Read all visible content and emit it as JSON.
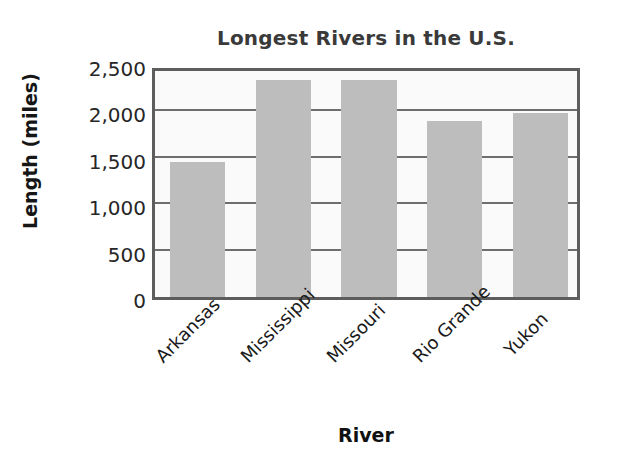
{
  "chart_data": {
    "type": "bar",
    "title": "Longest Rivers in the U.S.",
    "xlabel": "River",
    "ylabel": "Length (miles)",
    "categories": [
      "Arkansas",
      "Mississippi",
      "Missouri",
      "Rio Grande",
      "Yukon"
    ],
    "values": [
      1460,
      2340,
      2340,
      1900,
      1980
    ],
    "ylim": [
      0,
      2500
    ],
    "y_ticks": [
      0,
      500,
      1000,
      1500,
      2000,
      2500
    ],
    "y_tick_labels": [
      "0",
      "500",
      "1,000",
      "1,500",
      "2,000",
      "2,500"
    ],
    "grid": "horizontal",
    "legend": "none",
    "bar_color": "#bdbdbd",
    "frame_color": "#5d5d5d",
    "plot_background": "#fafafa",
    "title_color": "#3a3a3a"
  }
}
